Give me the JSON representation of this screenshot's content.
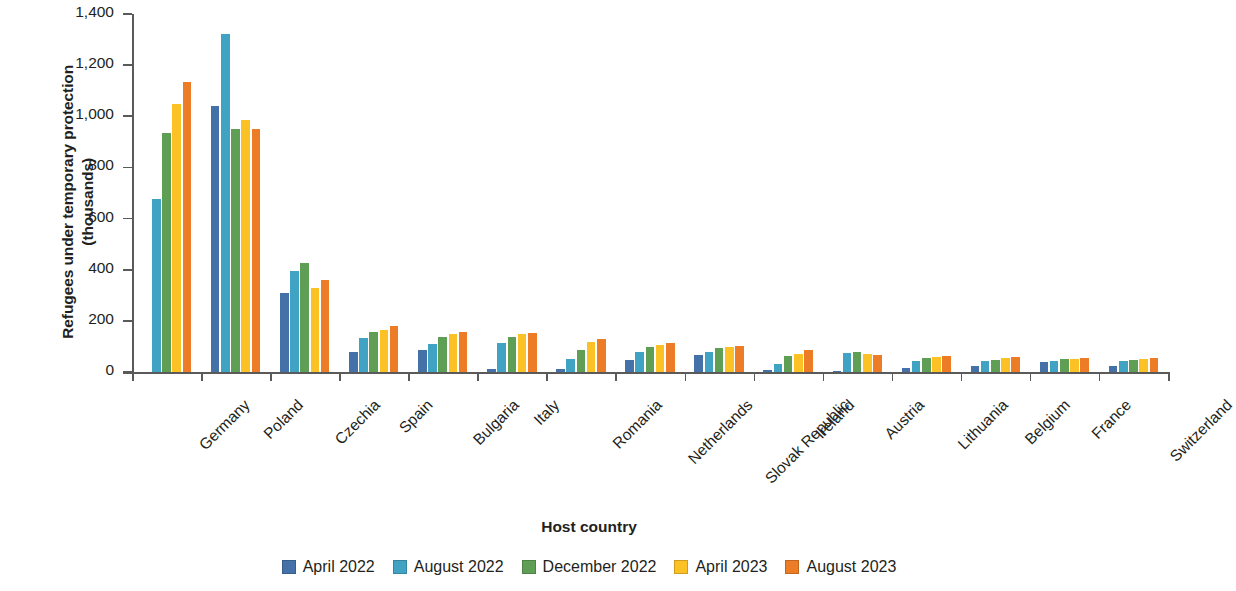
{
  "chart_data": {
    "type": "bar",
    "title": "",
    "xlabel": "Host country",
    "ylabel": "Refugees under temporary protection\n(thousands)",
    "ylim": [
      0,
      1400
    ],
    "yticks": [
      0,
      200,
      400,
      600,
      800,
      1000,
      1200,
      1400
    ],
    "ytick_labels": [
      "0",
      "200",
      "400",
      "600",
      "800",
      "1,000",
      "1,200",
      "1,400"
    ],
    "grid": false,
    "legend_position": "bottom",
    "categories": [
      "Germany",
      "Poland",
      "Czechia",
      "Spain",
      "Bulgaria",
      "Italy",
      "Romania",
      "Netherlands",
      "Slovak Republic",
      "Ireland",
      "Austria",
      "Lithuania",
      "Belgium",
      "France",
      "Switzerland"
    ],
    "series": [
      {
        "name": "April 2022",
        "color": "#4472A8",
        "values": [
          0,
          1040,
          310,
          78,
          88,
          12,
          10,
          46,
          68,
          7,
          2,
          15,
          25,
          38,
          22
        ]
      },
      {
        "name": "August 2022",
        "color": "#41A3C4",
        "values": [
          678,
          1320,
          395,
          133,
          108,
          113,
          52,
          77,
          80,
          33,
          75,
          44,
          42,
          45,
          44
        ]
      },
      {
        "name": "December 2022",
        "color": "#5E9E55",
        "values": [
          935,
          950,
          425,
          155,
          138,
          138,
          88,
          98,
          92,
          63,
          78,
          55,
          48,
          50,
          48
        ]
      },
      {
        "name": "April 2023",
        "color": "#FBC125",
        "values": [
          1048,
          985,
          330,
          165,
          150,
          148,
          118,
          105,
          98,
          72,
          70,
          60,
          55,
          52,
          52
        ]
      },
      {
        "name": "August 2023",
        "color": "#ED7C27",
        "values": [
          1133,
          950,
          360,
          178,
          157,
          152,
          130,
          115,
          100,
          85,
          68,
          63,
          58,
          55,
          55
        ]
      }
    ]
  }
}
